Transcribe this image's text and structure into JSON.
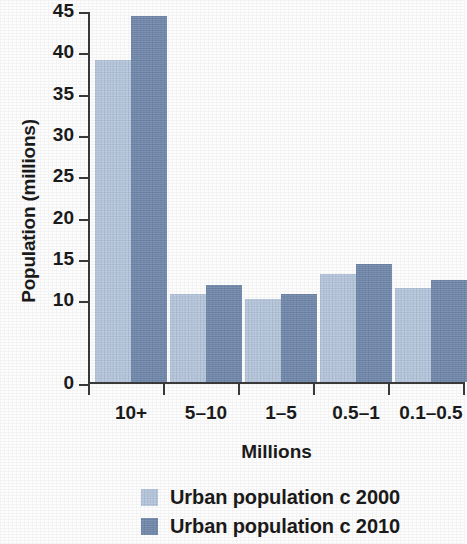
{
  "chart_data": {
    "type": "bar",
    "title": "",
    "subtitle": "",
    "xlabel": "Millions",
    "ylabel": "Population (millions)",
    "categories": [
      "10+",
      "5–10",
      "1–5",
      "0.5–1",
      "0.1–0.5"
    ],
    "series": [
      {
        "name": "Urban population c 2000",
        "color": "#b6c6dc",
        "values": [
          39.0,
          10.7,
          10.0,
          13.1,
          11.4
        ]
      },
      {
        "name": "Urban population c 2010",
        "color": "#7289ac",
        "values": [
          44.3,
          11.7,
          10.6,
          14.3,
          12.4
        ]
      }
    ],
    "ylim": [
      0,
      45
    ],
    "ytick_values": [
      0,
      10,
      15,
      20,
      25,
      30,
      35,
      40,
      45
    ],
    "ytick_labels": [
      "0",
      "10",
      "15",
      "20",
      "25",
      "30",
      "35",
      "40",
      "45"
    ],
    "grid": false,
    "legend_position": "bottom-center",
    "bar_group_spacing": true
  },
  "axes": {
    "y_title": "Population (millions)",
    "x_title": "Millions"
  },
  "legend": {
    "entries": [
      {
        "label": "Urban population c 2000",
        "color": "#b6c6dc"
      },
      {
        "label": "Urban population c 2010",
        "color": "#7289ac"
      }
    ]
  },
  "style": {
    "background": "#fdfdfd",
    "axis_color": "#3a3a3a",
    "text_color": "#1b1b1b"
  }
}
